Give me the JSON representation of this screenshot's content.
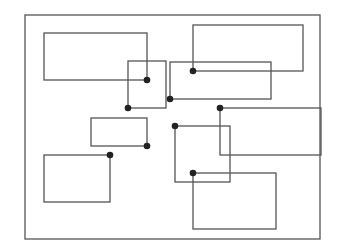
{
  "diagram": {
    "type": "rectangle-overlap-layout",
    "stroke_color": "#555555",
    "dot_color": "#222222",
    "frame": {
      "x": 25,
      "y": 15,
      "w": 295,
      "h": 224
    },
    "rectangles": [
      {
        "id": "r1",
        "x": 44,
        "y": 33,
        "w": 103,
        "h": 47,
        "anchor": [
          147,
          80
        ]
      },
      {
        "id": "r2",
        "x": 128,
        "y": 61,
        "w": 38,
        "h": 47,
        "anchor": [
          128,
          108
        ]
      },
      {
        "id": "r3",
        "x": 193,
        "y": 25,
        "w": 110,
        "h": 46,
        "anchor": [
          193,
          71
        ]
      },
      {
        "id": "r4",
        "x": 170,
        "y": 62,
        "w": 101,
        "h": 37,
        "anchor": [
          170,
          99
        ]
      },
      {
        "id": "r5",
        "x": 220,
        "y": 108,
        "w": 101,
        "h": 47,
        "anchor": [
          220,
          108
        ]
      },
      {
        "id": "r6",
        "x": 91,
        "y": 118,
        "w": 56,
        "h": 28,
        "anchor": [
          147,
          146
        ]
      },
      {
        "id": "r7",
        "x": 44,
        "y": 155,
        "w": 66,
        "h": 47,
        "anchor": [
          110,
          155
        ]
      },
      {
        "id": "r8",
        "x": 175,
        "y": 126,
        "w": 55,
        "h": 56,
        "anchor": [
          175,
          126
        ]
      },
      {
        "id": "r9",
        "x": 193,
        "y": 173,
        "w": 83,
        "h": 56,
        "anchor": [
          193,
          173
        ]
      }
    ]
  }
}
